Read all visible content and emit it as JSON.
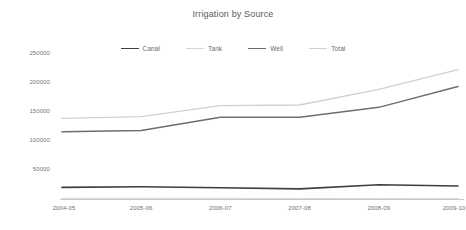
{
  "chart_data": {
    "type": "line",
    "title": "Irrigation by Source",
    "xlabel": "",
    "ylabel": "",
    "categories": [
      "2004-05",
      "2005-06",
      "2006-07",
      "2007-08",
      "2008-09",
      "2009-10"
    ],
    "ylim": [
      0,
      250000
    ],
    "ytick_labels": [
      "250000",
      "200000",
      "150000",
      "100000",
      "50000",
      "0"
    ],
    "ytick_values": [
      250000,
      200000,
      150000,
      100000,
      50000,
      0
    ],
    "grid": false,
    "legend_position": "top-center",
    "series": [
      {
        "name": "Canal",
        "color": "#3f3f3f",
        "width": 1.6,
        "values": [
          20000,
          21000,
          19500,
          17500,
          24500,
          22500
        ]
      },
      {
        "name": "Tank",
        "color": "#d6d6d6",
        "width": 1.0,
        "values": [
          1200,
          1100,
          1000,
          900,
          800,
          700
        ]
      },
      {
        "name": "Well",
        "color": "#6e6e6e",
        "width": 1.5,
        "values": [
          116000,
          118000,
          141000,
          141000,
          158000,
          194000
        ]
      },
      {
        "name": "Total",
        "color": "#d0d0d0",
        "width": 1.4,
        "values": [
          139000,
          142000,
          161000,
          162000,
          189000,
          223000
        ]
      }
    ]
  },
  "axis": {
    "line_color": "#c8c8c8",
    "text_color": "#767676"
  }
}
